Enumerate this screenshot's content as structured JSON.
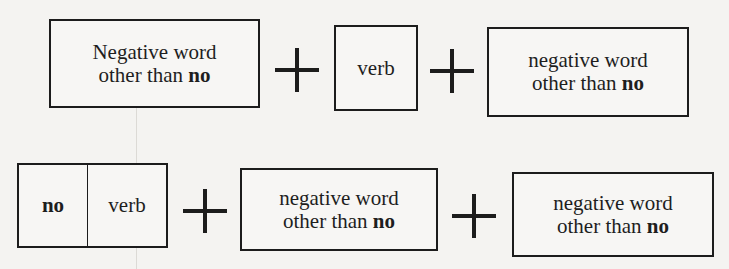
{
  "rows": [
    {
      "boxes": [
        {
          "line1": "Negative word",
          "line2_prefix": "other than ",
          "line2_bold": "no"
        },
        {
          "label": "verb"
        },
        {
          "line1": "negative word",
          "line2_prefix": "other than ",
          "line2_bold": "no"
        }
      ],
      "operators": [
        "+",
        "+"
      ]
    },
    {
      "boxes": [
        {
          "left": "no",
          "right": "verb"
        },
        {
          "line1": "negative word",
          "line2_prefix": "other than ",
          "line2_bold": "no"
        },
        {
          "line1": "negative word",
          "line2_prefix": "other than ",
          "line2_bold": "no"
        }
      ],
      "operators": [
        "+",
        "+"
      ]
    }
  ]
}
